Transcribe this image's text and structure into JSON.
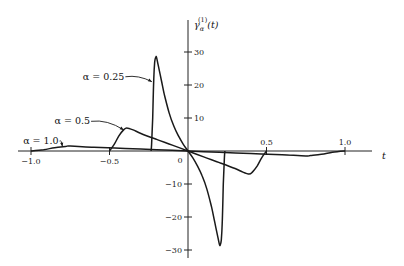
{
  "chart_data": {
    "type": "line",
    "title": "",
    "xlabel": "t",
    "ylabel": "γ_α^(1)(t)",
    "ylabel_parts": {
      "base": "γ",
      "sub": "α",
      "sup": "(1)",
      "arg": "(t)"
    },
    "xlim": [
      -1.0,
      1.0
    ],
    "ylim": [
      -30,
      30
    ],
    "grid": false,
    "legend": "inline annotations",
    "x_ticks": [
      {
        "value": -1.0,
        "label": "−1.0",
        "side": "below"
      },
      {
        "value": -0.5,
        "label": "−0.5",
        "side": "below"
      },
      {
        "value": 0.5,
        "label": "0.5",
        "side": "above"
      },
      {
        "value": 1.0,
        "label": "1.0",
        "side": "above"
      }
    ],
    "origin_label": "0",
    "y_ticks": [
      {
        "value": 30,
        "label": "30"
      },
      {
        "value": 20,
        "label": "20"
      },
      {
        "value": 10,
        "label": "10"
      },
      {
        "value": -10,
        "label": "−10"
      },
      {
        "value": -20,
        "label": "−20"
      },
      {
        "value": -30,
        "label": "−30"
      }
    ],
    "series": [
      {
        "name": "α = 1.0",
        "label": "α = 1.0",
        "x": [
          -1.0,
          -0.92,
          -0.85,
          -0.78,
          -0.75,
          -0.6,
          -0.4,
          -0.2,
          0.0,
          0.2,
          0.4,
          0.6,
          0.75,
          0.78,
          0.85,
          0.92,
          1.0
        ],
        "y": [
          0,
          0.4,
          1.0,
          1.4,
          1.5,
          1.15,
          0.8,
          0.4,
          0,
          -0.4,
          -0.8,
          -1.15,
          -1.5,
          -1.4,
          -1.0,
          -0.4,
          0
        ]
      },
      {
        "name": "α = 0.5",
        "label": "α = 0.5",
        "x": [
          -0.5,
          -0.47,
          -0.44,
          -0.41,
          -0.39,
          -0.35,
          -0.3,
          -0.2,
          -0.1,
          0.0,
          0.1,
          0.2,
          0.3,
          0.35,
          0.39,
          0.41,
          0.44,
          0.47,
          0.5
        ],
        "y": [
          0,
          2.0,
          4.6,
          6.4,
          7.0,
          6.4,
          5.3,
          3.5,
          1.8,
          0,
          -1.8,
          -3.5,
          -5.3,
          -6.4,
          -7.0,
          -6.4,
          -4.6,
          -2.0,
          0
        ]
      },
      {
        "name": "α = 0.25",
        "label": "α = 0.25",
        "x": [
          -0.235,
          -0.232,
          -0.225,
          -0.218,
          -0.212,
          -0.205,
          -0.2,
          -0.19,
          -0.17,
          -0.15,
          -0.12,
          -0.09,
          -0.06,
          -0.03,
          0.0,
          0.03,
          0.06,
          0.09,
          0.12,
          0.15,
          0.17,
          0.19,
          0.2,
          0.205,
          0.212,
          0.218,
          0.225,
          0.232,
          0.235
        ],
        "y": [
          0,
          2.0,
          10.0,
          22.0,
          27.0,
          28.5,
          28.3,
          26.0,
          21.5,
          17.0,
          11.5,
          7.5,
          4.5,
          2.0,
          0,
          -2.0,
          -4.5,
          -7.5,
          -11.5,
          -17.0,
          -21.5,
          -26.0,
          -28.3,
          -28.5,
          -27.0,
          -22.0,
          -10.0,
          -2.0,
          0
        ]
      }
    ],
    "annotations": [
      {
        "text": "α = 0.25",
        "target_series": "α = 0.25",
        "text_pos": [
          -0.67,
          22.5
        ],
        "point": [
          -0.23,
          21.0
        ]
      },
      {
        "text": "α = 0.5",
        "target_series": "α = 0.5",
        "text_pos": [
          -0.85,
          9.0
        ],
        "point": [
          -0.41,
          6.4
        ]
      },
      {
        "text": "α = 1.0",
        "target_series": "α = 1.0",
        "text_pos": [
          -1.05,
          3.0
        ],
        "point": [
          -0.8,
          1.4
        ]
      }
    ]
  }
}
